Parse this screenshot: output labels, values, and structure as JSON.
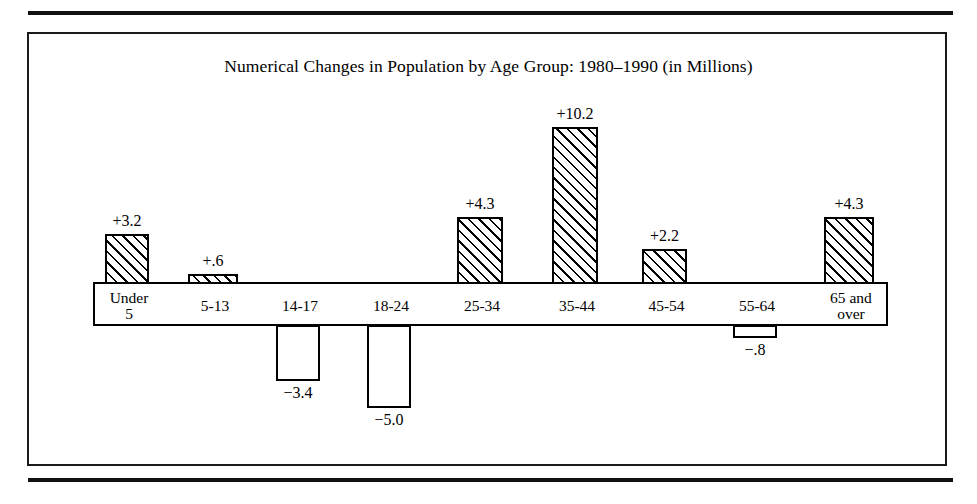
{
  "figure": {
    "title": "Numerical Changes in Population by Age Group: 1980–1990 (in Millions)"
  },
  "chart_data": {
    "type": "bar",
    "title": "Numerical Changes in Population by Age Group: 1980–1990 (in Millions)",
    "subtitle": "",
    "xlabel": "",
    "ylabel": "",
    "units": "Millions",
    "period": "1980–1990",
    "grid": false,
    "legend": false,
    "axis_baseline": 0,
    "ylim": [
      -5.0,
      10.2
    ],
    "categories": [
      "Under 5",
      "5-13",
      "14-17",
      "18-24",
      "25-34",
      "35-44",
      "45-54",
      "55-64",
      "65 and over"
    ],
    "values": [
      3.2,
      0.6,
      -3.4,
      -5.0,
      4.3,
      10.2,
      2.2,
      -0.8,
      4.3
    ],
    "data_labels": [
      "+3.2",
      "+.6",
      "−3.4",
      "−5.0",
      "+4.3",
      "+10.2",
      "+2.2",
      "−.8",
      "+4.3"
    ],
    "bars": [
      {
        "category_line1": "Under",
        "category_line2": "5",
        "value": 3.2,
        "label": "+3.2",
        "sign": "positive"
      },
      {
        "category_line1": "5-13",
        "category_line2": "",
        "value": 0.6,
        "label": "+.6",
        "sign": "positive"
      },
      {
        "category_line1": "14-17",
        "category_line2": "",
        "value": -3.4,
        "label": "−3.4",
        "sign": "negative"
      },
      {
        "category_line1": "18-24",
        "category_line2": "",
        "value": -5.0,
        "label": "−5.0",
        "sign": "negative"
      },
      {
        "category_line1": "25-34",
        "category_line2": "",
        "value": 4.3,
        "label": "+4.3",
        "sign": "positive"
      },
      {
        "category_line1": "35-44",
        "category_line2": "",
        "value": 10.2,
        "label": "+10.2",
        "sign": "positive"
      },
      {
        "category_line1": "45-54",
        "category_line2": "",
        "value": 2.2,
        "label": "+2.2",
        "sign": "positive"
      },
      {
        "category_line1": "55-64",
        "category_line2": "",
        "value": -0.8,
        "label": "−.8",
        "sign": "negative"
      },
      {
        "category_line1": "65 and",
        "category_line2": "over",
        "value": 4.3,
        "label": "+4.3",
        "sign": "positive"
      }
    ],
    "colors": {
      "positive_fill": "hatched-diagonal",
      "negative_fill": "#ffffff",
      "outline": "#000000",
      "background": "#ffffff"
    }
  },
  "geometry": {
    "baseline_y": 283,
    "px_per_unit_up": 15.3,
    "px_per_unit_down": 16.6,
    "bar_positions": [
      {
        "x": 105,
        "w": 44
      },
      {
        "x": 188,
        "w": 50
      },
      {
        "x": 276,
        "w": 44
      },
      {
        "x": 367,
        "w": 44
      },
      {
        "x": 457,
        "w": 46
      },
      {
        "x": 552,
        "w": 46
      },
      {
        "x": 642,
        "w": 45
      },
      {
        "x": 733,
        "w": 44
      },
      {
        "x": 824,
        "w": 50
      }
    ],
    "band_x": 93,
    "band_w": 795,
    "band_y": 282,
    "band_h": 44
  }
}
